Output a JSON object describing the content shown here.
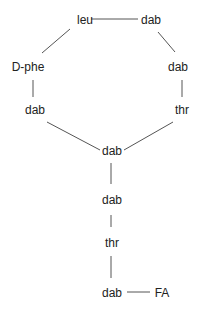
{
  "diagram": {
    "type": "peptide-structure",
    "line_color": "#555555",
    "text_color": "#222222",
    "nodes": [
      {
        "id": "leu",
        "label": "leu",
        "x": 85,
        "y": 20
      },
      {
        "id": "dab1",
        "label": "dab",
        "x": 151,
        "y": 20
      },
      {
        "id": "dphe",
        "label": "D-phe",
        "x": 28,
        "y": 67
      },
      {
        "id": "dab2",
        "label": "dab",
        "x": 178,
        "y": 67
      },
      {
        "id": "dab3",
        "label": "dab",
        "x": 35,
        "y": 110
      },
      {
        "id": "thr1",
        "label": "thr",
        "x": 182,
        "y": 110
      },
      {
        "id": "dab4",
        "label": "dab",
        "x": 112,
        "y": 151
      },
      {
        "id": "dab5",
        "label": "dab",
        "x": 112,
        "y": 200
      },
      {
        "id": "thr2",
        "label": "thr",
        "x": 112,
        "y": 243
      },
      {
        "id": "dab6",
        "label": "dab",
        "x": 112,
        "y": 293
      },
      {
        "id": "fa",
        "label": "FA",
        "x": 162,
        "y": 293
      }
    ],
    "edges": [
      {
        "from": "leu",
        "to": "dab1",
        "x1": 91,
        "y1": 19,
        "x2": 138,
        "y2": 19
      },
      {
        "from": "leu",
        "to": "dphe",
        "x1": 70,
        "y1": 29,
        "x2": 42,
        "y2": 53
      },
      {
        "from": "dab1",
        "to": "dab2",
        "x1": 158,
        "y1": 32,
        "x2": 175,
        "y2": 52
      },
      {
        "from": "dphe",
        "to": "dab3",
        "x1": 33,
        "y1": 80,
        "x2": 33,
        "y2": 97
      },
      {
        "from": "dab2",
        "to": "thr1",
        "x1": 182,
        "y1": 80,
        "x2": 182,
        "y2": 97
      },
      {
        "from": "dab3",
        "to": "dab4",
        "x1": 47,
        "y1": 122,
        "x2": 100,
        "y2": 150
      },
      {
        "from": "thr1",
        "to": "dab4",
        "x1": 173,
        "y1": 122,
        "x2": 124,
        "y2": 150
      },
      {
        "from": "dab4",
        "to": "dab5",
        "x1": 111,
        "y1": 163,
        "x2": 111,
        "y2": 184
      },
      {
        "from": "dab5",
        "to": "thr2",
        "x1": 111,
        "y1": 215,
        "x2": 111,
        "y2": 227
      },
      {
        "from": "thr2",
        "to": "dab6",
        "x1": 111,
        "y1": 256,
        "x2": 111,
        "y2": 278
      },
      {
        "from": "dab6",
        "to": "fa",
        "x1": 127,
        "y1": 292,
        "x2": 150,
        "y2": 292
      }
    ]
  }
}
